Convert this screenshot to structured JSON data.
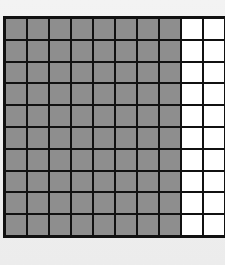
{
  "diagram": {
    "type": "hundred-grid",
    "rows": 10,
    "columns": 10,
    "shaded_columns": 8,
    "shaded_count": 80,
    "unshaded_count": 20,
    "total_cells": 100,
    "colors": {
      "shaded": "#8e8e8e",
      "unshaded": "#ffffff",
      "grid_lines": "#111111",
      "background": "#efefef"
    }
  }
}
